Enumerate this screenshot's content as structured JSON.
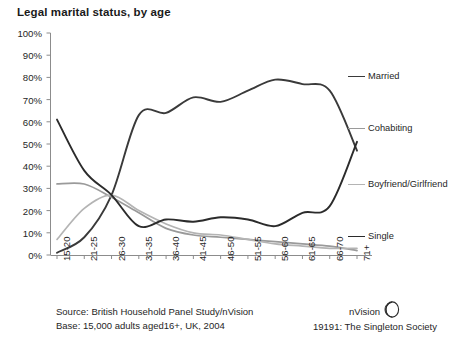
{
  "chart_title": "Legal marital status, by age",
  "footer": {
    "source_line": "Source: British Household Panel Study/nVision",
    "base_line": "Base: 15,000 adults aged16+, UK, 2004"
  },
  "brand": {
    "name": "nVision",
    "logo_icon": "nvision-sphere-icon",
    "caption": "19191: The Singleton Society"
  },
  "axis": {
    "y_ticks": [
      "0%",
      "10%",
      "20%",
      "30%",
      "40%",
      "50%",
      "60%",
      "70%",
      "80%",
      "90%",
      "100%"
    ],
    "x_ticks": [
      "15-20",
      "21-25",
      "26-30",
      "31-35",
      "36-40",
      "41-45",
      "46-50",
      "51-55",
      "56-60",
      "61-65",
      "66-70",
      "71+"
    ]
  },
  "legend": [
    {
      "label": "Married",
      "color": "#3a3a3a"
    },
    {
      "label": "Cohabiting",
      "color": "#9a9a9a"
    },
    {
      "label": "Boyfriend/Girlfriend",
      "color": "#b4b4b4"
    },
    {
      "label": "Single",
      "color": "#2b2b2b"
    }
  ],
  "chart_data": {
    "type": "line",
    "title": "Legal marital status, by age",
    "xlabel": "",
    "ylabel": "",
    "ylim": [
      0,
      100
    ],
    "grid": false,
    "legend_position": "right",
    "categories": [
      "15-20",
      "21-25",
      "26-30",
      "31-35",
      "36-40",
      "41-45",
      "46-50",
      "51-55",
      "56-60",
      "61-65",
      "66-70",
      "71+"
    ],
    "series": [
      {
        "name": "Married",
        "color": "#3a3a3a",
        "values": [
          1,
          8,
          27,
          63,
          64,
          71,
          69,
          74,
          79,
          77,
          74,
          47
        ]
      },
      {
        "name": "Cohabiting",
        "color": "#9a9a9a",
        "values": [
          32,
          32,
          26,
          19,
          12,
          9,
          8,
          7,
          6,
          5,
          4,
          2
        ]
      },
      {
        "name": "Boyfriend/Girlfriend",
        "color": "#b4b4b4",
        "values": [
          7,
          21,
          27,
          20,
          14,
          10,
          9,
          7,
          5,
          4,
          3,
          3
        ]
      },
      {
        "name": "Single",
        "color": "#2b2b2b",
        "values": [
          61,
          38,
          27,
          13,
          16,
          15,
          17,
          16,
          13,
          19,
          22,
          51
        ]
      }
    ]
  }
}
